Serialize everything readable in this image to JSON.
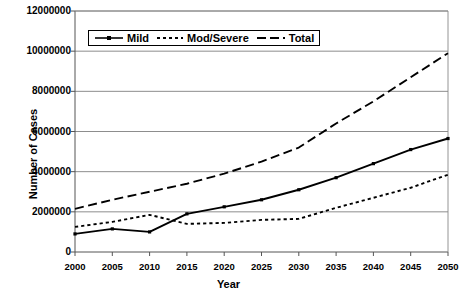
{
  "chart_data": {
    "type": "line",
    "title": "",
    "xlabel": "Year",
    "ylabel": "Number of Cases",
    "x": [
      2000,
      2005,
      2010,
      2015,
      2020,
      2025,
      2030,
      2035,
      2040,
      2045,
      2050
    ],
    "xtick_labels": [
      "2000",
      "2005",
      "2010",
      "2015",
      "2020",
      "2025",
      "2030",
      "2035",
      "2040",
      "2045",
      "2050"
    ],
    "ytick_labels": [
      "0",
      "2000000",
      "4000000",
      "6000000",
      "8000000",
      "10000000",
      "12000000"
    ],
    "ytick_values": [
      0,
      2000000,
      4000000,
      6000000,
      8000000,
      10000000,
      12000000
    ],
    "xlim": [
      2000,
      2050
    ],
    "ylim": [
      0,
      12000000
    ],
    "grid": "horizontal",
    "legend_position": "top-left-inside",
    "series": [
      {
        "name": "Mild",
        "style": "solid",
        "marker": "square",
        "color": "#000000",
        "values": [
          900000,
          1150000,
          1000000,
          1900000,
          2250000,
          2600000,
          3100000,
          3700000,
          4400000,
          5100000,
          5650000
        ]
      },
      {
        "name": "Mod/Severe",
        "style": "dotted",
        "marker": "none",
        "color": "#000000",
        "values": [
          1250000,
          1500000,
          1850000,
          1400000,
          1450000,
          1600000,
          1650000,
          2200000,
          2700000,
          3200000,
          3850000
        ]
      },
      {
        "name": "Total",
        "style": "dashed",
        "marker": "none",
        "color": "#000000",
        "values": [
          2150000,
          2600000,
          3000000,
          3400000,
          3900000,
          4500000,
          5200000,
          6400000,
          7500000,
          8700000,
          9900000
        ]
      }
    ]
  },
  "legend": {
    "entries": [
      {
        "label": "Mild"
      },
      {
        "label": "Mod/Severe"
      },
      {
        "label": "Total"
      }
    ]
  },
  "axes": {
    "x_title": "Year",
    "y_title": "Number of Cases"
  }
}
